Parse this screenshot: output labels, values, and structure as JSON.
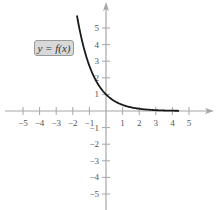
{
  "chart_data": {
    "type": "line",
    "title": "",
    "xlabel": "",
    "ylabel": "",
    "xlim": [
      -5.5,
      6.3
    ],
    "ylim": [
      -6,
      6.4
    ],
    "grid": false,
    "x_ticks": [
      -5,
      -4,
      -3,
      -2,
      -1,
      1,
      2,
      3,
      4,
      5
    ],
    "y_ticks": [
      5,
      4,
      3,
      2,
      1,
      -1,
      -2,
      -3,
      -4,
      -5
    ],
    "annotations": [
      {
        "text": "y = f(x)",
        "x": -3.8,
        "y": 3.8
      }
    ],
    "series": [
      {
        "name": "y = f(x)",
        "function": "exp(-x)",
        "x": [
          -1.75,
          -1.5,
          -1,
          -0.5,
          0,
          0.5,
          1,
          1.5,
          2,
          3,
          4,
          4.4
        ],
        "y": [
          5.75,
          4.48,
          2.72,
          1.65,
          1.0,
          0.61,
          0.37,
          0.22,
          0.14,
          0.05,
          0.02,
          0.01
        ],
        "color": "#1a1a1a"
      }
    ]
  },
  "label": {
    "text": "y = f(x)"
  },
  "colors": {
    "axis": "#a6a6a6",
    "curve": "#1a1a1a",
    "label_bg": "#d9d9d9"
  }
}
